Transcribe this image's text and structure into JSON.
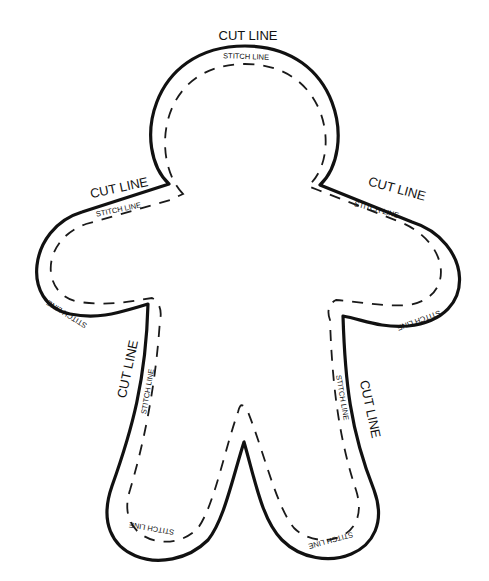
{
  "pattern": {
    "subject": "Gingerbread man sewing template",
    "colors": {
      "background": "#ffffff",
      "line": "#111111"
    },
    "labels": {
      "cut_head": "CUT LINE",
      "cut_left_arm": "CUT LINE",
      "cut_right_arm": "CUT LINE",
      "cut_left_leg": "CUT LINE",
      "cut_right_leg": "CUT LINE",
      "stitch_head": "STITCH LINE",
      "stitch_left_arm_top": "STITCH LINE",
      "stitch_right_arm_top": "STITCH LINE",
      "stitch_left_arm_bottom": "STITCH LINE",
      "stitch_right_arm_bottom": "STITCH LINE",
      "stitch_left_leg": "STITCH LINE",
      "stitch_right_leg": "STITCH LINE",
      "stitch_left_foot": "STITCH LINE",
      "stitch_right_foot": "STITCH LINE"
    }
  }
}
